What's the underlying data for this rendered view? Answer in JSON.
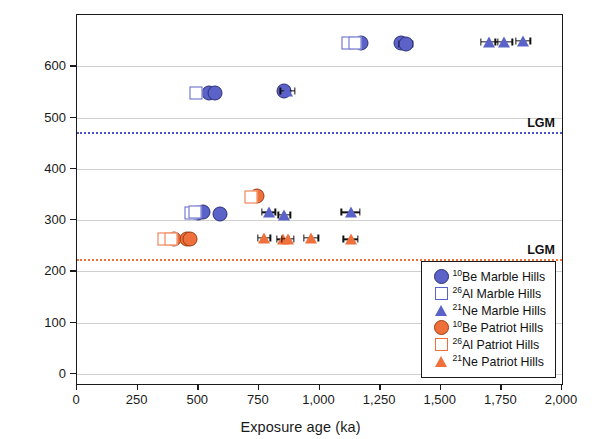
{
  "chart_data": {
    "type": "scatter",
    "title": "",
    "xlabel": "Exposure age (ka)",
    "ylabel": "Elevation above ice margin (m)",
    "xlim": [
      0,
      2000
    ],
    "ylim": [
      -20,
      700
    ],
    "xticks": [
      0,
      250,
      500,
      750,
      1000,
      1250,
      1500,
      1750,
      2000
    ],
    "xticklabels": [
      "0",
      "250",
      "500",
      "750",
      "1,000",
      "1,250",
      "1,500",
      "1,750",
      "2,000"
    ],
    "yticks": [
      0,
      100,
      200,
      300,
      400,
      500,
      600
    ],
    "yticklabels": [
      "0",
      "100",
      "200",
      "300",
      "400",
      "500",
      "600"
    ],
    "grid": "horizontal",
    "legend_position": "bottom-right",
    "annotations": [
      {
        "name": "lgm-marble-hills",
        "label": "LGM",
        "y": 472,
        "color": "#4a55c6",
        "style": "dotted"
      },
      {
        "name": "lgm-patriot-hills",
        "label": "LGM",
        "y": 223,
        "color": "#f0703c",
        "style": "dotted"
      }
    ],
    "series": [
      {
        "name": "10Be Marble Hills",
        "label": "Be Marble Hills",
        "superscript": "10",
        "marker": "filled-circle",
        "color": "#5b62c8",
        "points": [
          {
            "x": 545,
            "y": 548,
            "xerr": 0
          },
          {
            "x": 568,
            "y": 548,
            "xerr": 0
          },
          {
            "x": 855,
            "y": 552,
            "xerr": 22
          },
          {
            "x": 1170,
            "y": 645,
            "xerr": 0
          },
          {
            "x": 1335,
            "y": 645,
            "xerr": 0
          },
          {
            "x": 1355,
            "y": 643,
            "xerr": 28
          },
          {
            "x": 500,
            "y": 313,
            "xerr": 0
          },
          {
            "x": 520,
            "y": 315,
            "xerr": 0
          },
          {
            "x": 588,
            "y": 311,
            "xerr": 0
          }
        ]
      },
      {
        "name": "26Al Marble Hills",
        "label": "Al Marble Hills",
        "superscript": "26",
        "marker": "open-square",
        "color": "#5b62c8",
        "points": [
          {
            "x": 492,
            "y": 548,
            "xerr": 22
          },
          {
            "x": 1118,
            "y": 645,
            "xerr": 0
          },
          {
            "x": 1148,
            "y": 645,
            "xerr": 18
          },
          {
            "x": 470,
            "y": 313,
            "xerr": 0
          },
          {
            "x": 487,
            "y": 316,
            "xerr": 0
          }
        ]
      },
      {
        "name": "21Ne Marble Hills",
        "label": "Ne Marble Hills",
        "superscript": "21",
        "marker": "filled-triangle",
        "color": "#5b62c8",
        "points": [
          {
            "x": 868,
            "y": 552,
            "xerr": 30
          },
          {
            "x": 1700,
            "y": 648,
            "xerr": 35
          },
          {
            "x": 1760,
            "y": 648,
            "xerr": 35
          },
          {
            "x": 1840,
            "y": 650,
            "xerr": 30
          },
          {
            "x": 790,
            "y": 315,
            "xerr": 28
          },
          {
            "x": 855,
            "y": 310,
            "xerr": 25
          },
          {
            "x": 1128,
            "y": 315,
            "xerr": 38
          }
        ]
      },
      {
        "name": "10Be Patriot Hills",
        "label": "Be Patriot Hills",
        "superscript": "10",
        "marker": "filled-circle",
        "color": "#f0703c",
        "points": [
          {
            "x": 398,
            "y": 263,
            "xerr": 0
          },
          {
            "x": 455,
            "y": 263,
            "xerr": 0
          },
          {
            "x": 468,
            "y": 262,
            "xerr": 0
          },
          {
            "x": 742,
            "y": 347,
            "xerr": 0
          }
        ]
      },
      {
        "name": "26Al Patriot Hills",
        "label": "Al Patriot Hills",
        "superscript": "26",
        "marker": "open-square",
        "color": "#f0703c",
        "points": [
          {
            "x": 360,
            "y": 262,
            "xerr": 20
          },
          {
            "x": 388,
            "y": 262,
            "xerr": 18
          },
          {
            "x": 718,
            "y": 345,
            "xerr": 0
          }
        ]
      },
      {
        "name": "21Ne Patriot Hills",
        "label": "Ne Patriot Hills",
        "superscript": "21",
        "marker": "filled-triangle",
        "color": "#f0703c",
        "points": [
          {
            "x": 772,
            "y": 265,
            "xerr": 25
          },
          {
            "x": 848,
            "y": 262,
            "xerr": 25
          },
          {
            "x": 870,
            "y": 263,
            "xerr": 25
          },
          {
            "x": 965,
            "y": 265,
            "xerr": 30
          },
          {
            "x": 1128,
            "y": 262,
            "xerr": 30
          }
        ]
      }
    ]
  }
}
